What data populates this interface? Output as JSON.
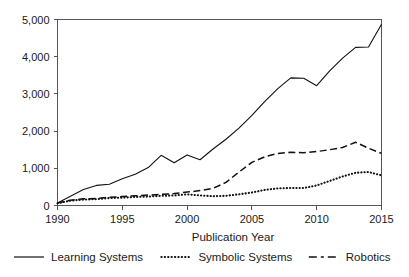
{
  "chart_data": {
    "type": "line",
    "title": "",
    "xlabel": "Publication Year",
    "ylabel": "",
    "xlim": [
      1990,
      2015
    ],
    "ylim": [
      0,
      5000
    ],
    "grid": false,
    "legend_position": "bottom",
    "x": [
      1990,
      1991,
      1992,
      1993,
      1994,
      1995,
      1996,
      1997,
      1998,
      1999,
      2000,
      2001,
      2002,
      2003,
      2004,
      2005,
      2006,
      2007,
      2008,
      2009,
      2010,
      2011,
      2012,
      2013,
      2014,
      2015
    ],
    "xticks": [
      1990,
      1995,
      2000,
      2005,
      2010,
      2015
    ],
    "xtick_labels": [
      "1990",
      "1995",
      "2000",
      "2005",
      "2010",
      "2015"
    ],
    "yticks": [
      0,
      1000,
      2000,
      3000,
      4000,
      5000
    ],
    "ytick_labels": [
      "0",
      "1,000",
      "2,000",
      "3,000",
      "4,000",
      "5,000"
    ],
    "series": [
      {
        "name": "Learning Systems",
        "style": "solid",
        "color": "#111111",
        "values": [
          70,
          250,
          430,
          540,
          570,
          720,
          840,
          1020,
          1350,
          1150,
          1360,
          1230,
          1520,
          1780,
          2080,
          2420,
          2800,
          3140,
          3430,
          3420,
          3220,
          3620,
          3960,
          4250,
          4260,
          4870
        ]
      },
      {
        "name": "Symbolic Systems",
        "style": "dotted",
        "color": "#111111",
        "values": [
          60,
          130,
          160,
          170,
          200,
          210,
          230,
          240,
          260,
          270,
          300,
          270,
          250,
          260,
          300,
          350,
          420,
          460,
          470,
          470,
          540,
          660,
          780,
          880,
          900,
          810
        ]
      },
      {
        "name": "Robotics",
        "style": "dashed",
        "color": "#111111",
        "values": [
          70,
          140,
          180,
          190,
          220,
          240,
          260,
          280,
          300,
          320,
          360,
          400,
          460,
          620,
          900,
          1160,
          1310,
          1400,
          1430,
          1420,
          1450,
          1500,
          1560,
          1700,
          1540,
          1400
        ]
      }
    ]
  },
  "legend": {
    "items": [
      {
        "label": "Learning Systems",
        "style": "solid"
      },
      {
        "label": "Symbolic Systems",
        "style": "dotted"
      },
      {
        "label": "Robotics",
        "style": "dashed"
      }
    ]
  },
  "axes": {
    "x_title": "Publication Year"
  }
}
